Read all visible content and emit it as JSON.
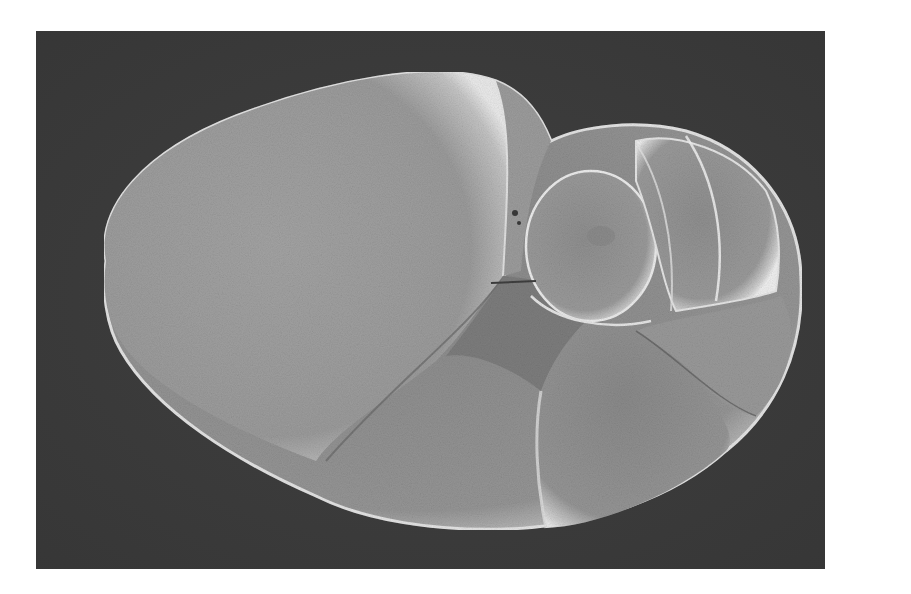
{
  "image": {
    "kind": "scanning electron micrograph",
    "subject": "foraminifera test (shell), umbilical/spiral view showing inflated chambers",
    "alt": "Grayscale SEM image of a foraminifera shell with a large final chamber on the left and a coiled series of smaller rounded chambers on the right, on a dark grainy background",
    "colors": {
      "page_background": "#ffffff",
      "image_background": "#3b3b3b",
      "shell_mid": "#9a9a9a",
      "shell_highlight": "#e6e6e6",
      "shell_shadow": "#6e6e6e",
      "suture_dark": "#555555"
    }
  }
}
